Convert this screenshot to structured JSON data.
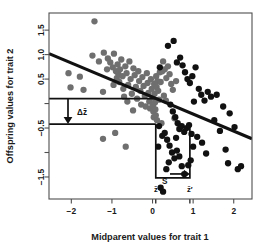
{
  "chart_data": {
    "type": "scatter",
    "title": "",
    "xlabel": "Midparent values for trait 1",
    "ylabel": "Offspring values for trait 2",
    "xlim": [
      -2.55,
      2.45
    ],
    "ylim": [
      -1.95,
      1.85
    ],
    "xticks": [
      -2,
      -1,
      0,
      1,
      2
    ],
    "xtick_labels": [
      "−2",
      "−1",
      "0",
      "1",
      "2"
    ],
    "yticks": [
      1.5,
      1.0,
      0.5,
      0.0,
      -0.5,
      -1.0,
      -1.5
    ],
    "ytick_labels": [
      "1.5",
      "1.0",
      "0.5",
      "",
      "−0.5",
      "",
      "−1.5"
    ],
    "grid": false,
    "legend": "none",
    "series": [
      {
        "name": "unselected",
        "color": "#6f6f6f",
        "marker": "circle",
        "points": [
          [
            -1.43,
            1.68
          ],
          [
            -2.07,
            0.62
          ],
          [
            -2.02,
            0.33
          ],
          [
            -1.79,
            0.55
          ],
          [
            -1.7,
            0.28
          ],
          [
            -1.22,
            0.24
          ],
          [
            -1.1,
            0.92
          ],
          [
            -1.04,
            0.84
          ],
          [
            -0.98,
            0.74
          ],
          [
            -0.95,
            1.02
          ],
          [
            -0.9,
            0.66
          ],
          [
            -0.88,
            0.52
          ],
          [
            -0.86,
            0.8
          ],
          [
            -0.84,
            0.6
          ],
          [
            -0.82,
            0.44
          ],
          [
            -0.8,
            0.7
          ],
          [
            -0.77,
            0.9
          ],
          [
            -0.74,
            0.56
          ],
          [
            -0.72,
            0.3
          ],
          [
            -0.7,
            0.14
          ],
          [
            -0.67,
            0.76
          ],
          [
            -0.64,
            0.62
          ],
          [
            -0.6,
            0.38
          ],
          [
            -0.57,
            0.86
          ],
          [
            -0.54,
            0.5
          ],
          [
            -0.51,
            0.2
          ],
          [
            -0.47,
            0.72
          ],
          [
            -0.44,
            0.58
          ],
          [
            -0.41,
            0.34
          ],
          [
            -0.38,
            0.1
          ],
          [
            -0.35,
            0.66
          ],
          [
            -0.33,
            0.46
          ],
          [
            -0.3,
            0.26
          ],
          [
            -0.28,
            -0.02
          ],
          [
            -0.25,
            0.54
          ],
          [
            -0.22,
            0.36
          ],
          [
            -0.19,
            0.16
          ],
          [
            -0.17,
            -0.06
          ],
          [
            -0.14,
            0.62
          ],
          [
            -0.12,
            0.42
          ],
          [
            -0.1,
            0.22
          ],
          [
            -0.08,
            0.04
          ],
          [
            -0.06,
            -0.1
          ],
          [
            -0.04,
            0.5
          ],
          [
            -0.02,
            0.3
          ],
          [
            0.0,
            0.12
          ],
          [
            0.01,
            -0.04
          ],
          [
            0.02,
            -0.16
          ],
          [
            0.03,
            -0.28
          ],
          [
            0.04,
            0.4
          ],
          [
            0.05,
            0.2
          ],
          [
            0.06,
            0.02
          ],
          [
            0.07,
            -0.12
          ],
          [
            0.08,
            -0.24
          ],
          [
            0.09,
            0.56
          ],
          [
            0.1,
            0.34
          ],
          [
            0.11,
            -0.34
          ],
          [
            0.12,
            0.46
          ],
          [
            0.14,
            0.26
          ],
          [
            0.16,
            0.08
          ],
          [
            0.18,
            0.64
          ],
          [
            0.2,
            0.44
          ],
          [
            0.22,
            -0.4
          ],
          [
            0.26,
            0.86
          ],
          [
            0.3,
            0.7
          ],
          [
            0.34,
            0.52
          ],
          [
            0.38,
            0.76
          ],
          [
            0.42,
            0.6
          ],
          [
            0.46,
            0.4
          ],
          [
            0.5,
            0.28
          ],
          [
            0.54,
            -0.3
          ],
          [
            0.58,
            0.46
          ],
          [
            -1.22,
            -0.72
          ],
          [
            -0.92,
            -0.6
          ],
          [
            -0.66,
            -0.88
          ],
          [
            -1.48,
            0.98
          ],
          [
            -1.32,
            0.86
          ],
          [
            -1.2,
            1.04
          ],
          [
            -1.12,
            0.7
          ],
          [
            -0.96,
            0.38
          ],
          [
            0.24,
            0.66
          ],
          [
            0.28,
            0.16
          ],
          [
            0.33,
            0.06
          ],
          [
            -0.62,
            0.04
          ],
          [
            -0.48,
            -0.14
          ]
        ]
      },
      {
        "name": "selected",
        "color": "#111111",
        "marker": "circle",
        "points": [
          [
            0.52,
            1.28
          ],
          [
            0.38,
            1.18
          ],
          [
            0.68,
            0.94
          ],
          [
            0.74,
            0.78
          ],
          [
            0.6,
            0.84
          ],
          [
            0.8,
            0.64
          ],
          [
            0.86,
            0.5
          ],
          [
            0.92,
            0.42
          ],
          [
            0.98,
            0.56
          ],
          [
            1.06,
            0.74
          ],
          [
            1.14,
            0.3
          ],
          [
            1.2,
            0.18
          ],
          [
            1.28,
            0.06
          ],
          [
            1.36,
            0.24
          ],
          [
            1.44,
            0.14
          ],
          [
            1.58,
            0.18
          ],
          [
            1.66,
            -0.56
          ],
          [
            1.74,
            -0.06
          ],
          [
            1.8,
            -0.94
          ],
          [
            1.86,
            -1.22
          ],
          [
            2.02,
            -0.48
          ],
          [
            2.1,
            -1.34
          ],
          [
            2.18,
            -1.28
          ],
          [
            0.44,
            -0.02
          ],
          [
            0.5,
            -0.16
          ],
          [
            0.56,
            -0.28
          ],
          [
            0.62,
            -0.4
          ],
          [
            0.66,
            -0.52
          ],
          [
            0.72,
            -0.46
          ],
          [
            0.78,
            -0.58
          ],
          [
            0.84,
            -0.5
          ],
          [
            0.9,
            -0.44
          ],
          [
            0.96,
            -0.62
          ],
          [
            0.3,
            -0.6
          ],
          [
            0.36,
            -0.74
          ],
          [
            0.42,
            -0.86
          ],
          [
            0.48,
            -1.0
          ],
          [
            0.54,
            -1.12
          ],
          [
            0.6,
            -0.96
          ],
          [
            0.66,
            -1.08
          ],
          [
            0.72,
            -1.28
          ],
          [
            0.78,
            -1.44
          ],
          [
            0.26,
            -1.8
          ],
          [
            0.34,
            -1.34
          ],
          [
            0.4,
            -1.2
          ],
          [
            1.0,
            -0.88
          ],
          [
            1.1,
            -0.68
          ],
          [
            1.22,
            -0.8
          ],
          [
            1.32,
            -1.02
          ],
          [
            0.2,
            -1.72
          ],
          [
            0.18,
            0.74
          ],
          [
            0.16,
            -0.46
          ],
          [
            1.52,
            -0.34
          ],
          [
            1.9,
            -0.2
          ],
          [
            0.24,
            -0.66
          ],
          [
            0.88,
            -1.26
          ],
          [
            0.94,
            -1.16
          ],
          [
            1.02,
            0.04
          ],
          [
            0.14,
            -0.88
          ],
          [
            0.58,
            -0.7
          ]
        ]
      }
    ],
    "regression_line": {
      "name": "regression-line",
      "x_start": -2.55,
      "y_start": 1.02,
      "x_end": 2.45,
      "y_end": -0.72,
      "color": "#111111"
    },
    "annotations": {
      "delta_z_label": "Δz̄",
      "s_label": "S",
      "z_bar_label": "z̄",
      "z_bar_prime_label": "z̄′",
      "delta_z_upper_y": 0.1,
      "delta_z_lower_y": -0.42,
      "s_left_x": 0.08,
      "s_right_x": 0.92,
      "s_bottom_y": -1.52,
      "z_bar_x": 0.08,
      "z_bar_prime_x": 0.92
    }
  }
}
